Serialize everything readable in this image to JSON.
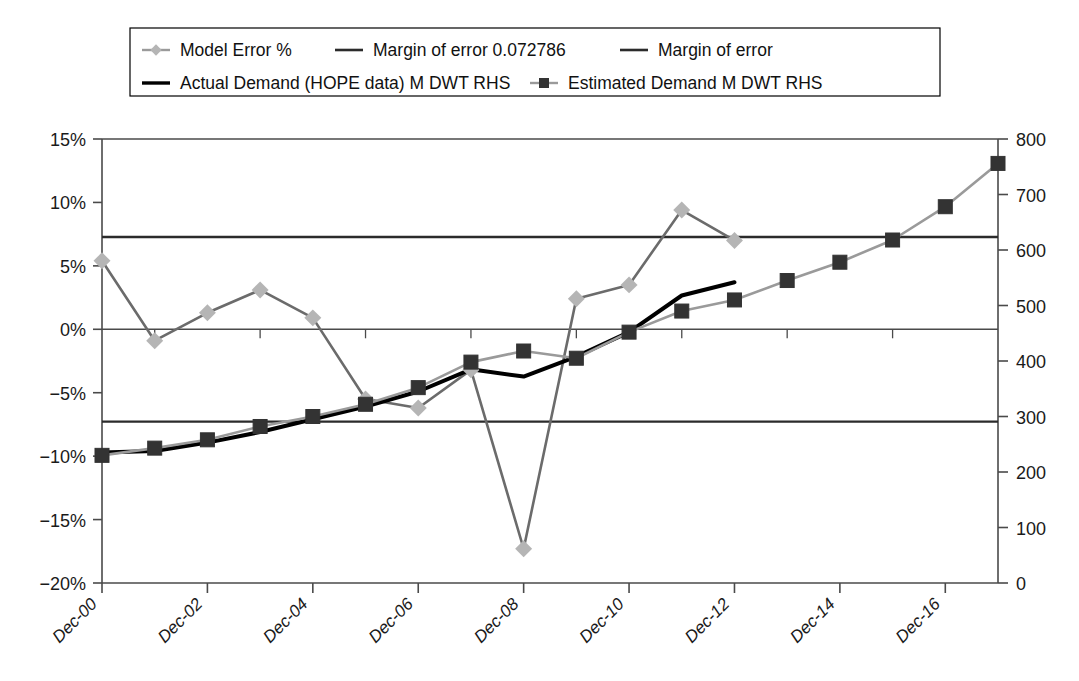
{
  "chart_data": {
    "type": "line",
    "title": "",
    "xlabel": "",
    "ylabel": "",
    "grid": false,
    "legend_position": "top",
    "x": [
      "Dec-00",
      "Dec-01",
      "Dec-02",
      "Dec-03",
      "Dec-04",
      "Dec-05",
      "Dec-06",
      "Dec-07",
      "Dec-08",
      "Dec-09",
      "Dec-10",
      "Dec-11",
      "Dec-12",
      "Dec-13",
      "Dec-14",
      "Dec-15",
      "Dec-16",
      "Dec-17"
    ],
    "xtick_labels": [
      "Dec-00",
      "Dec-02",
      "Dec-04",
      "Dec-06",
      "Dec-08",
      "Dec-10",
      "Dec-12",
      "Dec-14",
      "Dec-16"
    ],
    "left_axis": {
      "label": "",
      "ylim": [
        -20,
        15
      ],
      "ticks": [
        15,
        10,
        5,
        0,
        -5,
        -10,
        -15,
        -20
      ],
      "tick_labels": [
        "15%",
        "10%",
        "5%",
        "0%",
        "−5%",
        "−10%",
        "−15%",
        "−20%"
      ]
    },
    "right_axis": {
      "label": "",
      "ylim": [
        0,
        800
      ],
      "ticks": [
        800,
        700,
        600,
        500,
        400,
        300,
        200,
        100,
        0
      ],
      "tick_labels": [
        "800",
        "700",
        "600",
        "500",
        "400",
        "300",
        "200",
        "100",
        "0"
      ]
    },
    "series": [
      {
        "name": "Model Error %",
        "axis": "left",
        "color": "#6b6b6b",
        "marker": "diamond",
        "marker_color": "#b5b5b5",
        "values": [
          5.4,
          -0.9,
          1.3,
          3.1,
          0.9,
          -5.5,
          -6.2,
          -3.2,
          -17.3,
          2.4,
          3.5,
          9.4,
          7.0,
          null,
          null,
          null,
          null,
          null
        ]
      },
      {
        "name": "Margin of error 0.072786",
        "axis": "left",
        "color": "#2b2b2b",
        "marker": "none",
        "constant": 7.2786
      },
      {
        "name": "Margin of error",
        "axis": "left",
        "color": "#2b2b2b",
        "marker": "none",
        "constant": -7.2786
      },
      {
        "name": "Actual Demand (HOPE data) M DWT RHS",
        "axis": "right",
        "color": "#000000",
        "marker": "none",
        "values": [
          235,
          238,
          253,
          272,
          295,
          318,
          345,
          385,
          372,
          408,
          452,
          518,
          542,
          null,
          null,
          null,
          null,
          null
        ]
      },
      {
        "name": "Estimated Demand M DWT RHS",
        "axis": "right",
        "color": "#9a9a9a",
        "marker": "square",
        "marker_color": "#333333",
        "values": [
          230,
          243,
          258,
          282,
          300,
          322,
          352,
          398,
          418,
          405,
          452,
          490,
          510,
          545,
          578,
          618,
          678,
          756
        ]
      }
    ],
    "margin_of_error_value": 0.072786
  },
  "legend": {
    "items": [
      {
        "label": "Model Error %",
        "marker": "diamond-line",
        "color": "#b5b5b5",
        "line_color": "#9a9a9a"
      },
      {
        "label": "Margin of error 0.072786",
        "marker": "line",
        "color": "#2b2b2b",
        "line_color": "#2b2b2b"
      },
      {
        "label": "Margin of error",
        "marker": "line",
        "color": "#2b2b2b",
        "line_color": "#2b2b2b"
      },
      {
        "label": "Actual Demand (HOPE data) M DWT RHS",
        "marker": "line-thick",
        "color": "#000000",
        "line_color": "#000000"
      },
      {
        "label": "Estimated Demand M DWT RHS",
        "marker": "square-line",
        "color": "#333333",
        "line_color": "#9a9a9a"
      }
    ]
  }
}
